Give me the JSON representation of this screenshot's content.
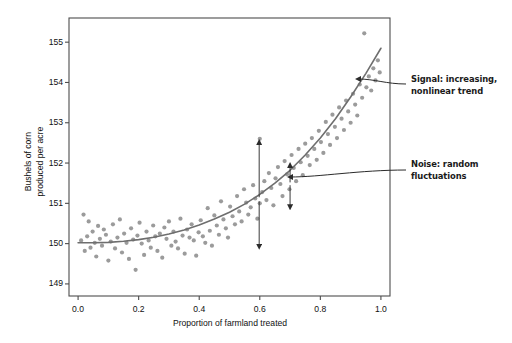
{
  "chart_data": {
    "type": "scatter",
    "title": "",
    "xlabel": "Proportion of farmland treated",
    "ylabel": "Bushels of corn\nproduced per acre",
    "ylabel_lines": [
      "Bushels of corn",
      "produced per acre"
    ],
    "xlim": [
      -0.03,
      1.03
    ],
    "ylim": [
      148.7,
      155.6
    ],
    "xticks": [
      0.0,
      0.2,
      0.4,
      0.6,
      0.8,
      1.0
    ],
    "xticklabels": [
      "0.0",
      "0.2",
      "0.4",
      "0.6",
      "0.8",
      "1.0"
    ],
    "yticks": [
      149,
      150,
      151,
      152,
      153,
      154,
      155
    ],
    "yticklabels": [
      "149",
      "150",
      "151",
      "152",
      "153",
      "154",
      "155"
    ],
    "grid": false,
    "legend": null,
    "point_color": "#9b9b9b",
    "line_color": "#6e6e6e",
    "frame_color": "#4d4d4d",
    "series": [
      {
        "name": "observations",
        "marker": "circle",
        "x": [
          0.01,
          0.018,
          0.022,
          0.03,
          0.035,
          0.041,
          0.048,
          0.055,
          0.06,
          0.066,
          0.072,
          0.079,
          0.085,
          0.092,
          0.1,
          0.108,
          0.115,
          0.122,
          0.13,
          0.138,
          0.145,
          0.152,
          0.16,
          0.168,
          0.175,
          0.182,
          0.19,
          0.196,
          0.203,
          0.21,
          0.218,
          0.226,
          0.233,
          0.24,
          0.248,
          0.255,
          0.262,
          0.27,
          0.278,
          0.285,
          0.292,
          0.3,
          0.308,
          0.315,
          0.322,
          0.33,
          0.338,
          0.345,
          0.352,
          0.36,
          0.368,
          0.375,
          0.382,
          0.39,
          0.398,
          0.405,
          0.412,
          0.42,
          0.428,
          0.435,
          0.442,
          0.45,
          0.458,
          0.465,
          0.472,
          0.48,
          0.488,
          0.495,
          0.502,
          0.51,
          0.518,
          0.525,
          0.532,
          0.54,
          0.548,
          0.555,
          0.562,
          0.57,
          0.578,
          0.585,
          0.592,
          0.6,
          0.6,
          0.608,
          0.615,
          0.622,
          0.63,
          0.638,
          0.645,
          0.652,
          0.66,
          0.668,
          0.675,
          0.682,
          0.69,
          0.698,
          0.705,
          0.712,
          0.72,
          0.728,
          0.735,
          0.742,
          0.75,
          0.758,
          0.765,
          0.772,
          0.78,
          0.788,
          0.795,
          0.802,
          0.81,
          0.818,
          0.825,
          0.832,
          0.84,
          0.848,
          0.855,
          0.862,
          0.87,
          0.878,
          0.885,
          0.892,
          0.9,
          0.908,
          0.915,
          0.922,
          0.93,
          0.938,
          0.945,
          0.952,
          0.96,
          0.968,
          0.975,
          0.982,
          0.99,
          0.996
        ],
        "y": [
          150.08,
          150.72,
          149.82,
          150.18,
          150.55,
          149.9,
          150.3,
          150.02,
          149.68,
          150.44,
          150.12,
          149.95,
          150.35,
          150.22,
          149.58,
          150.05,
          150.48,
          149.88,
          150.15,
          150.6,
          149.78,
          150.25,
          150.02,
          149.62,
          150.38,
          150.1,
          149.35,
          150.2,
          150.52,
          150.0,
          149.72,
          150.3,
          150.08,
          149.9,
          150.45,
          150.18,
          149.82,
          150.25,
          149.65,
          150.4,
          150.12,
          150.55,
          149.95,
          150.3,
          150.05,
          149.88,
          150.62,
          150.2,
          149.75,
          150.35,
          150.15,
          150.48,
          150.08,
          149.7,
          150.28,
          150.58,
          150.18,
          150.02,
          150.88,
          150.32,
          149.95,
          150.7,
          150.45,
          150.22,
          151.05,
          150.6,
          150.38,
          150.15,
          150.92,
          150.68,
          150.48,
          151.18,
          150.8,
          150.55,
          151.35,
          151.02,
          150.72,
          150.9,
          151.45,
          151.12,
          150.62,
          152.6,
          151.0,
          151.28,
          151.55,
          151.08,
          151.75,
          151.38,
          150.95,
          151.62,
          151.9,
          151.48,
          151.18,
          152.05,
          151.72,
          151.35,
          152.2,
          151.88,
          151.55,
          152.35,
          152.02,
          151.7,
          152.48,
          152.18,
          151.95,
          152.62,
          152.35,
          152.08,
          152.8,
          152.52,
          152.25,
          153.02,
          152.72,
          152.45,
          153.2,
          152.9,
          152.62,
          153.38,
          153.1,
          152.82,
          153.55,
          153.28,
          153.0,
          153.72,
          153.45,
          153.18,
          153.95,
          153.62,
          155.22,
          153.88,
          154.15,
          153.8,
          154.35,
          154.05,
          154.55,
          154.25
        ]
      }
    ],
    "trend": {
      "name": "signal-curve",
      "type": "smooth-nonlinear",
      "description": "increasing nonlinear trend fit",
      "points_x": [
        0.0,
        0.05,
        0.1,
        0.15,
        0.2,
        0.25,
        0.3,
        0.35,
        0.4,
        0.45,
        0.5,
        0.55,
        0.6,
        0.65,
        0.7,
        0.75,
        0.8,
        0.85,
        0.9,
        0.95,
        1.0
      ],
      "points_y": [
        150.02,
        150.02,
        150.03,
        150.06,
        150.1,
        150.16,
        150.24,
        150.34,
        150.46,
        150.61,
        150.78,
        150.98,
        151.22,
        151.5,
        151.82,
        152.2,
        152.62,
        153.1,
        153.64,
        154.22,
        154.85
      ]
    },
    "residual_arrows": [
      {
        "x": 0.598,
        "y_from": 151.15,
        "y_to": 152.52,
        "direction": "up"
      },
      {
        "x": 0.598,
        "y_from": 151.05,
        "y_to": 149.92,
        "direction": "down"
      },
      {
        "x": 0.7,
        "y_from": 151.52,
        "y_to": 151.95,
        "direction": "up"
      },
      {
        "x": 0.7,
        "y_from": 151.45,
        "y_to": 150.9,
        "direction": "down"
      }
    ],
    "annotations": [
      {
        "id": "signal",
        "lines": [
          "Signal: increasing,",
          "nonlinear trend"
        ],
        "text": "Signal: increasing, nonlinear trend",
        "target_x": 0.905,
        "target_y": 154.05
      },
      {
        "id": "noise",
        "lines": [
          "Noise: random",
          "fluctuations"
        ],
        "text": "Noise: random fluctuations",
        "target_x": 0.69,
        "target_y": 151.58
      }
    ]
  }
}
